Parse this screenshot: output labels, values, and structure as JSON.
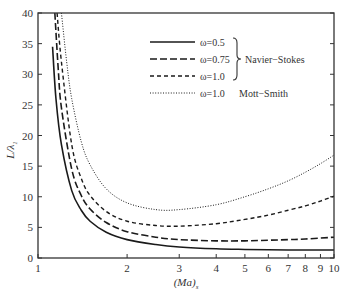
{
  "chart_data": {
    "type": "line",
    "title": "",
    "xlabel": "(Ma)_s",
    "ylabel": "L/λ1",
    "xscale": "log",
    "xlim": [
      1,
      10
    ],
    "ylim": [
      0,
      40
    ],
    "x_ticks": [
      1,
      2,
      3,
      4,
      5,
      6,
      7,
      8,
      9,
      10
    ],
    "y_ticks": [
      0,
      5,
      10,
      15,
      20,
      25,
      30,
      35,
      40
    ],
    "grid": false,
    "legend_position": "upper right",
    "legend_groups": [
      {
        "label": "Navier-Stokes",
        "members": [
          "ω=0.5",
          "ω=0.75",
          "ω=1.0"
        ]
      },
      {
        "label": "Mott-Smith",
        "members": [
          "ω=1.0 (Mott-Smith)"
        ]
      }
    ],
    "series": [
      {
        "name": "ω=0.5",
        "group": "Navier-Stokes",
        "style": "solid",
        "x": [
          1.12,
          1.15,
          1.2,
          1.3,
          1.4,
          1.5,
          1.7,
          2.0,
          2.5,
          3.0,
          4.0,
          5.0,
          6.0,
          7.0,
          8.0,
          10.0
        ],
        "y": [
          34.5,
          26.0,
          18.5,
          11.0,
          7.8,
          6.0,
          4.2,
          3.0,
          2.2,
          1.8,
          1.5,
          1.4,
          1.35,
          1.3,
          1.3,
          1.3
        ]
      },
      {
        "name": "ω=0.75",
        "group": "Navier-Stokes",
        "style": "long-dash",
        "x": [
          1.14,
          1.17,
          1.2,
          1.3,
          1.4,
          1.5,
          1.7,
          2.0,
          2.5,
          3.0,
          4.0,
          5.0,
          6.0,
          7.0,
          8.0,
          10.0
        ],
        "y": [
          40.0,
          31.0,
          24.5,
          14.5,
          10.2,
          8.0,
          5.8,
          4.3,
          3.4,
          3.0,
          2.8,
          2.8,
          2.9,
          3.0,
          3.1,
          3.4
        ]
      },
      {
        "name": "ω=1.0",
        "group": "Navier-Stokes",
        "style": "short-dash",
        "x": [
          1.16,
          1.2,
          1.3,
          1.4,
          1.5,
          1.7,
          2.0,
          2.5,
          3.0,
          4.0,
          5.0,
          6.0,
          7.0,
          8.0,
          9.0,
          10.0
        ],
        "y": [
          40.0,
          32.0,
          18.5,
          13.0,
          10.2,
          7.6,
          6.0,
          5.3,
          5.2,
          5.6,
          6.3,
          7.0,
          7.8,
          8.5,
          9.3,
          10.1
        ]
      },
      {
        "name": "ω=1.0 (Mott-Smith)",
        "group": "Mott-Smith",
        "style": "dotted",
        "x": [
          1.2,
          1.25,
          1.3,
          1.4,
          1.5,
          1.7,
          2.0,
          2.5,
          3.0,
          4.0,
          5.0,
          6.0,
          7.0,
          8.0,
          9.0,
          10.0
        ],
        "y": [
          40.0,
          32.0,
          26.0,
          19.0,
          15.2,
          11.3,
          9.0,
          7.9,
          7.9,
          8.7,
          10.0,
          11.3,
          12.6,
          14.0,
          15.4,
          16.8
        ]
      }
    ]
  },
  "legend": {
    "entries": [
      {
        "label": "ω=0.5",
        "style": "solid"
      },
      {
        "label": "ω=0.75",
        "style": "long-dash"
      },
      {
        "label": "ω=1.0",
        "style": "short-dash"
      },
      {
        "label": "ω=1.0",
        "style": "dotted"
      }
    ],
    "brace_label": "Navier−Stokes",
    "mott_label": "Mott−Smith"
  },
  "axes": {
    "ylabel_main": "L/λ",
    "ylabel_sub": "1",
    "xlabel_main": "(Ma)",
    "xlabel_sub": "s"
  },
  "colors": {
    "line": "#1a1a1a",
    "axis": "#333333"
  }
}
